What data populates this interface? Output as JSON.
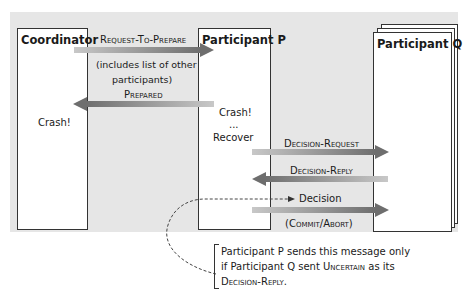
{
  "participants": {
    "coordinator": "Coordinator",
    "p": "Participant P",
    "q": "Participant Q"
  },
  "messages": {
    "request_to_prepare": "Request-To-Prepare",
    "request_note_line1": "(includes list of other",
    "request_note_line2": "participants)",
    "prepared": "Prepared",
    "decision_request": "Decision-Request",
    "decision_reply": "Decision-Reply",
    "decision": "Decision",
    "decision_note": "(Commit/Abort)"
  },
  "events": {
    "coordinator_crash": "Crash!",
    "p_crash": "Crash!",
    "p_dots": "...",
    "p_recover": "Recover"
  },
  "note": {
    "line1": "Participant P sends this message only",
    "line2_a": "if Participant Q sent ",
    "line2_sc": "Uncertain",
    "line2_b": " as its",
    "line3_sc": "Decision-Reply",
    "line3_b": "."
  },
  "colors": {
    "background_panel": "#e6e6e6",
    "arrow_dark": "#6e6e6e",
    "arrow_light": "#c8c8c8",
    "box_border": "#333333"
  }
}
